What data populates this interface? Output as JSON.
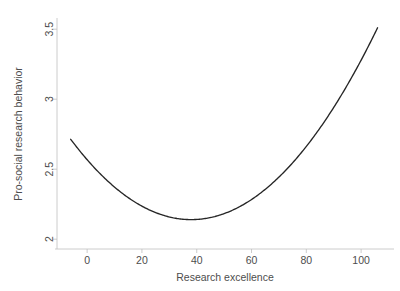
{
  "chart_data": {
    "type": "line",
    "title": "",
    "subtitle": "",
    "xlabel": "Research excellence",
    "ylabel": "Pro-social research behavior",
    "xlim": [
      -11,
      112
    ],
    "ylim": [
      1.93,
      3.58
    ],
    "xticks": [
      0,
      20,
      40,
      60,
      80,
      100
    ],
    "xtick_labels": [
      "0",
      "20",
      "40",
      "60",
      "80",
      "100"
    ],
    "yticks": [
      2,
      2.5,
      3,
      3.5
    ],
    "ytick_labels": [
      "2",
      "2.5",
      "3",
      "3.5"
    ],
    "grid": false,
    "legend": false,
    "legend_position": "none",
    "line_color": "#262626",
    "axis_color": "#bfbfbf",
    "text_color": "#4d4d4d",
    "background_color": "#ffffff",
    "annotations": [],
    "series": [
      {
        "name": "Pro-social research behavior",
        "shape": "quadratic-u",
        "vertex_x": 38,
        "vertex_y": 2.14,
        "x": [
          -6,
          0,
          5,
          10,
          15,
          20,
          25,
          30,
          35,
          38,
          40,
          45,
          50,
          55,
          60,
          65,
          70,
          75,
          80,
          85,
          90,
          95,
          100,
          106
        ],
        "values": [
          2.66,
          2.53,
          2.44,
          2.36,
          2.29,
          2.24,
          2.19,
          2.16,
          2.14,
          2.14,
          2.14,
          2.15,
          2.18,
          2.22,
          2.27,
          2.34,
          2.42,
          2.51,
          2.62,
          2.74,
          2.88,
          3.03,
          3.2,
          3.51
        ]
      }
    ]
  },
  "figure": {
    "y_axis_title": "Pro-social research behavior",
    "x_axis_title": "Research excellence"
  }
}
